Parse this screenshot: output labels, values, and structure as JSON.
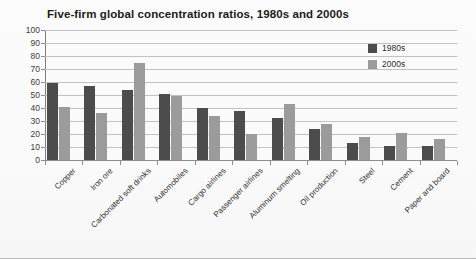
{
  "chart_data": {
    "type": "bar",
    "title": "Five-firm global concentration ratios, 1980s and 2000s",
    "xlabel": "",
    "ylabel": "",
    "ylim": [
      0,
      100
    ],
    "ytick_step": 10,
    "yticks": [
      0,
      10,
      20,
      30,
      40,
      50,
      60,
      70,
      80,
      90,
      100
    ],
    "grid": true,
    "legend_position": "top-right-inside",
    "categories": [
      "Copper",
      "Iron ore",
      "Carbonated soft drinks",
      "Automobiles",
      "Cargo airlines",
      "Passenger airlines",
      "Aluminum smelting",
      "Oil production",
      "Steel",
      "Cement",
      "Paper and board"
    ],
    "series": [
      {
        "name": "1980s",
        "color": "#4c4c4c",
        "values": [
          59,
          57,
          54,
          51,
          40,
          38,
          32,
          24,
          13,
          11,
          11
        ]
      },
      {
        "name": "2000s",
        "color": "#9b9b9b",
        "values": [
          41,
          36,
          75,
          49,
          34,
          20,
          43,
          28,
          18,
          21,
          16
        ]
      }
    ]
  },
  "legend": {
    "items": [
      {
        "label": "1980s",
        "color": "#4c4c4c"
      },
      {
        "label": "2000s",
        "color": "#9b9b9b"
      }
    ]
  }
}
